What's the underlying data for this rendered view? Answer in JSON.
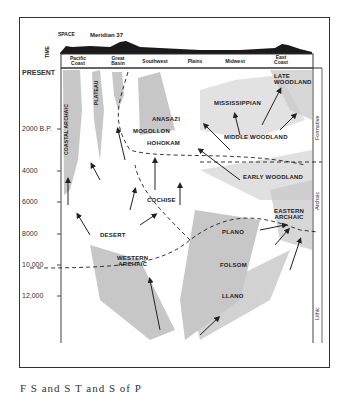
{
  "header": {
    "space_label": "SPACE",
    "time_label": "TIME",
    "meridian_label": "Meridian 37"
  },
  "regions": [
    {
      "label": "Pacific\nCoast"
    },
    {
      "label": "Great\nBasin"
    },
    {
      "label": "Southwest"
    },
    {
      "label": "Plains"
    },
    {
      "label": "Midwest"
    },
    {
      "label": "East\nCoast"
    }
  ],
  "time_axis": [
    "PRESENT",
    "2000 B.P.",
    "4000",
    "6000",
    "8000",
    "10,000",
    "12,000"
  ],
  "stages": [
    {
      "label": "Formative"
    },
    {
      "label": "Archaic"
    },
    {
      "label": "Lithic"
    }
  ],
  "traditions": {
    "coastal_archaic": "COASTAL ARCHAIC",
    "plateau": "PLATEAU",
    "anasazi": "ANASAZI",
    "mogollon": "MOGOLLON",
    "hohokam": "HOHOKAM",
    "cochise": "COCHISE",
    "desert": "DESERT",
    "western_archaic": "WESTERN\nARCHAIC",
    "mississippian": "MISSISSIPPIAN",
    "middle_woodland": "MIDDLE WOODLAND",
    "late_woodland": "LATE\nWOODLAND",
    "early_woodland": "EARLY WOODLAND",
    "eastern_archaic": "EASTERN\nARCHAIC",
    "plano": "PLANO",
    "folsom": "FOLSOM",
    "llano": "LLANO"
  },
  "caption": "F          S     and S           T         and S       of P"
}
